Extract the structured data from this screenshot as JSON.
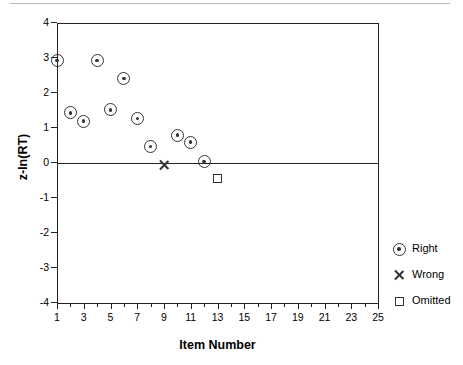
{
  "chart_data": {
    "type": "scatter",
    "title": "",
    "xlabel": "Item Number",
    "ylabel": "z-ln(RT)",
    "xlim": [
      1,
      25
    ],
    "ylim": [
      -4,
      4
    ],
    "grid": false,
    "zero_reference_line": 0,
    "legend_position": "right",
    "x_major_ticks": [
      1,
      3,
      5,
      7,
      9,
      11,
      13,
      15,
      17,
      19,
      21,
      23,
      25
    ],
    "x_minor_ticks": [
      2,
      4,
      6,
      8,
      10,
      12,
      14,
      16,
      18,
      20,
      22,
      24
    ],
    "x_tick_labels": [
      "1",
      "3",
      "5",
      "7",
      "9",
      "11",
      "13",
      "15",
      "17",
      "19",
      "21",
      "23",
      "25"
    ],
    "y_ticks": [
      4,
      3,
      2,
      1,
      0,
      -1,
      -2,
      -3,
      -4
    ],
    "y_tick_labels": [
      "4",
      "3",
      "2",
      "1",
      "0",
      "-1",
      "-2",
      "-3",
      "-4"
    ],
    "series": [
      {
        "name": "Right",
        "marker": "circle-dot",
        "color": "#333333",
        "points": [
          {
            "x": 1,
            "y": 2.93
          },
          {
            "x": 2,
            "y": 1.43
          },
          {
            "x": 3,
            "y": 1.2
          },
          {
            "x": 4,
            "y": 2.93
          },
          {
            "x": 5,
            "y": 1.52
          },
          {
            "x": 6,
            "y": 2.42
          },
          {
            "x": 7,
            "y": 1.28
          },
          {
            "x": 8,
            "y": 0.47
          },
          {
            "x": 10,
            "y": 0.8
          },
          {
            "x": 11,
            "y": 0.6
          },
          {
            "x": 12,
            "y": 0.05
          }
        ]
      },
      {
        "name": "Wrong",
        "marker": "x",
        "color": "#333333",
        "points": [
          {
            "x": 9,
            "y": -0.05
          }
        ]
      },
      {
        "name": "Omitted",
        "marker": "square",
        "color": "#333333",
        "points": [
          {
            "x": 13,
            "y": -0.45
          }
        ]
      }
    ]
  },
  "legend": {
    "items": [
      {
        "label": "Right",
        "marker": "circle-dot"
      },
      {
        "label": "Wrong",
        "marker": "x"
      },
      {
        "label": "Omitted",
        "marker": "square"
      }
    ]
  }
}
